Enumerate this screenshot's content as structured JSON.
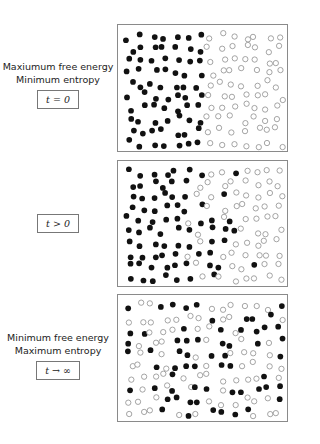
{
  "figure": {
    "panels": [
      {
        "id": "initial",
        "caption_lines": [
          "Maxiumum free energy",
          "Minimum entropy"
        ],
        "time_label": "t = 0",
        "box": {
          "top": 24,
          "height": 128
        },
        "description": "Black particles confined to left half, white particles to right half"
      },
      {
        "id": "mixing",
        "caption_lines": [],
        "time_label": "t > 0",
        "box": {
          "top": 160,
          "height": 127
        },
        "description": "Particles partially mixed near the interface"
      },
      {
        "id": "equilibrium",
        "caption_lines": [
          "Minimum free energy",
          "Maximum entropy"
        ],
        "time_label": "t → ∞",
        "box": {
          "top": 294,
          "height": 128
        },
        "description": "Black and white particles uniformly mixed"
      }
    ],
    "legend": {
      "filled": "black particle",
      "hollow": "white particle"
    },
    "colors": {
      "filled": "#111111",
      "hollow_stroke": "#8c8c8c",
      "border": "#8a8a8a"
    }
  }
}
